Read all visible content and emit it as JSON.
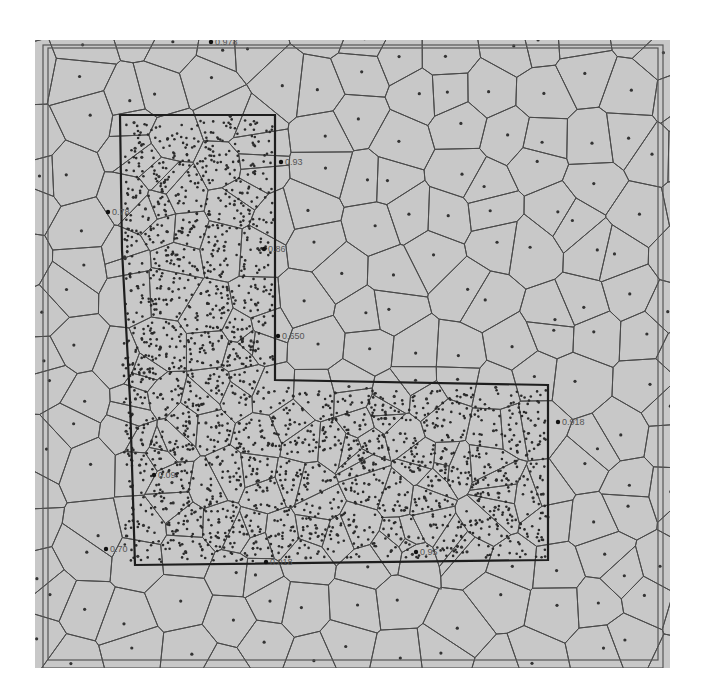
{
  "figure": {
    "background_color": "#c8c8c8",
    "line_color": "#4a4a4a",
    "point_color": "#2a2a2a",
    "region_outline_color": "#1e1e1e"
  },
  "labels": [
    {
      "id": "lbl-top",
      "text": "0.978",
      "x": 215,
      "y": 45
    },
    {
      "id": "lbl-right-upper",
      "text": "0.93",
      "x": 285,
      "y": 165
    },
    {
      "id": "lbl-left-upper",
      "text": "0.78",
      "x": 112,
      "y": 215
    },
    {
      "id": "lbl-right-mid",
      "text": "0.86",
      "x": 268,
      "y": 252
    },
    {
      "id": "lbl-inner-corner",
      "text": "0.650",
      "x": 282,
      "y": 339
    },
    {
      "id": "lbl-far-right",
      "text": "0.918",
      "x": 562,
      "y": 425
    },
    {
      "id": "lbl-left-lower",
      "text": "0.09",
      "x": 158,
      "y": 478
    },
    {
      "id": "lbl-bottom-left",
      "text": "0.70",
      "x": 110,
      "y": 552
    },
    {
      "id": "lbl-bottom-mid",
      "text": "0.018",
      "x": 270,
      "y": 565
    },
    {
      "id": "lbl-bottom-right",
      "text": "0.95",
      "x": 420,
      "y": 555
    }
  ]
}
